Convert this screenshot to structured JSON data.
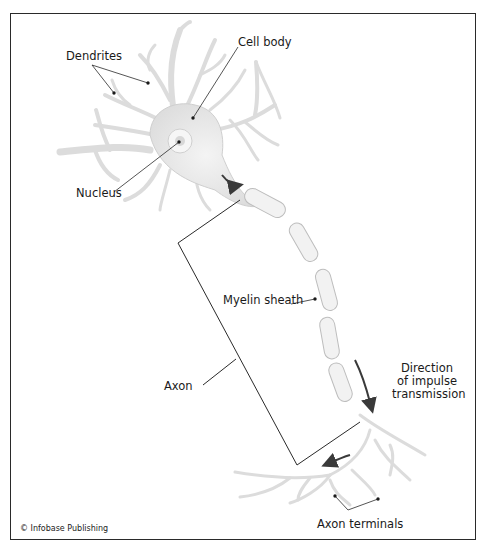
{
  "diagram": {
    "labels": {
      "dendrites": "Dendrites",
      "cell_body": "Cell body",
      "nucleus": "Nucleus",
      "myelin_sheath": "Myelin sheath",
      "axon": "Axon",
      "direction_line1": "Direction",
      "direction_line2": "of impulse",
      "direction_line3": "transmission",
      "axon_terminals": "Axon terminals"
    },
    "copyright": "© Infobase Publishing",
    "colors": {
      "neuron_fill": "#e6e6e6",
      "neuron_stroke": "#bdbdbd",
      "leader_line": "#2a2a2a",
      "arrow": "#3a3a3a",
      "frame": "#2a2a2a"
    }
  }
}
